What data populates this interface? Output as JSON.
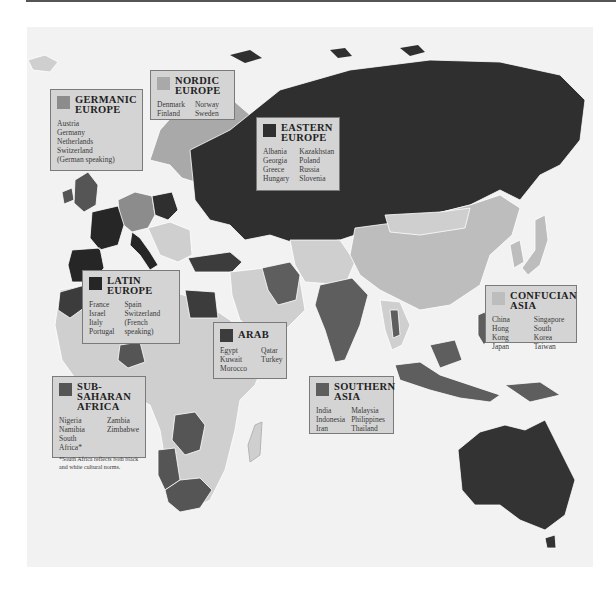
{
  "map": {
    "description": "Cultural clusters of Europe, Asia, Africa and Oceania",
    "colors": {
      "ocean": "#f2f2f2",
      "unclassified_land": "#cfcfcf",
      "border": "#ffffff",
      "germanic": "#8c8c8c",
      "nordic": "#a9a9a9",
      "eastern": "#2f2f2f",
      "latin": "#262626",
      "arab": "#3c3c3c",
      "sub_saharan": "#555555",
      "southern_asia": "#5e5e5e",
      "confucian": "#bdbdbd",
      "australia": "#333333"
    }
  },
  "legends": [
    {
      "id": "germanic",
      "title_line1": "GERMANIC",
      "title_line2": "EUROPE",
      "swatch": "#8c8c8c",
      "col1": [
        "Austria",
        "Germany",
        "Netherlands",
        "Switzerland",
        "(German speaking)"
      ],
      "col2": []
    },
    {
      "id": "nordic",
      "title_line1": "NORDIC",
      "title_line2": "EUROPE",
      "swatch": "#a9a9a9",
      "col1": [
        "Denmark",
        "Finland"
      ],
      "col2": [
        "Norway",
        "Sweden"
      ]
    },
    {
      "id": "eastern",
      "title_line1": "EASTERN",
      "title_line2": "EUROPE",
      "swatch": "#2f2f2f",
      "col1": [
        "Albania",
        "Georgia",
        "Greece",
        "Hungary"
      ],
      "col2": [
        "Kazakhstan",
        "Poland",
        "Russia",
        "Slovenia"
      ]
    },
    {
      "id": "latin",
      "title_line1": "LATIN",
      "title_line2": "EUROPE",
      "swatch": "#262626",
      "col1": [
        "France",
        "Israel",
        "Italy",
        "Portugal"
      ],
      "col2": [
        "Spain",
        "Switzerland",
        "(French speaking)"
      ]
    },
    {
      "id": "arab",
      "title_line1": "ARAB",
      "title_line2": "",
      "swatch": "#3c3c3c",
      "col1": [
        "Egypt",
        "Kuwait",
        "Morocco"
      ],
      "col2": [
        "Qatar",
        "Turkey"
      ]
    },
    {
      "id": "sub_saharan",
      "title_line1": "SUB-SAHARAN",
      "title_line2": "AFRICA",
      "swatch": "#555555",
      "col1": [
        "Nigeria",
        "Namibia",
        "South Africa*"
      ],
      "col2": [
        "Zambia",
        "Zimbabwe"
      ],
      "note": "*South Africa reflects both black and white cultural norms."
    },
    {
      "id": "southern_asia",
      "title_line1": "SOUTHERN",
      "title_line2": "ASIA",
      "swatch": "#5e5e5e",
      "col1": [
        "India",
        "Indonesia",
        "Iran"
      ],
      "col2": [
        "Malaysia",
        "Philippines",
        "Thailand"
      ]
    },
    {
      "id": "confucian",
      "title_line1": "CONFUCIAN",
      "title_line2": "ASIA",
      "swatch": "#bdbdbd",
      "col1": [
        "China",
        "Hong Kong",
        "Japan"
      ],
      "col2": [
        "Singapore",
        "South Korea",
        "Taiwan"
      ]
    }
  ]
}
